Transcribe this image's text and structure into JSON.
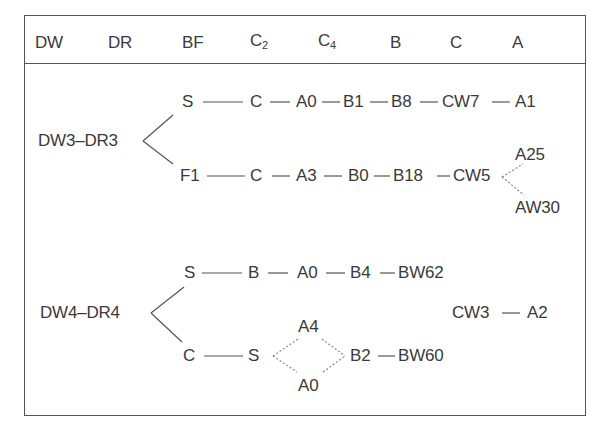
{
  "header": {
    "columns": [
      {
        "label": "DW"
      },
      {
        "label": "DR"
      },
      {
        "label": "BF"
      },
      {
        "label": "C",
        "sub": "2"
      },
      {
        "label": "C",
        "sub": "4"
      },
      {
        "label": "B"
      },
      {
        "label": "C"
      },
      {
        "label": "A"
      }
    ]
  },
  "group1": {
    "root": "DW3–DR3",
    "branch_upper": {
      "nodes": [
        "S",
        "C",
        "A0",
        "B1",
        "B8",
        "CW7",
        "A1"
      ]
    },
    "branch_lower": {
      "nodes": [
        "F1",
        "C",
        "A3",
        "B0",
        "B18",
        "CW5"
      ],
      "fork": [
        "A25",
        "AW30"
      ]
    }
  },
  "group2": {
    "root": "DW4–DR4",
    "branch_upper": {
      "nodes": [
        "S",
        "B",
        "A0",
        "B4",
        "BW62"
      ]
    },
    "branch_lower": {
      "nodes": [
        "C",
        "S"
      ],
      "fork": [
        "A4",
        "A0"
      ],
      "after_fork": [
        "B2",
        "BW60"
      ]
    },
    "detached": [
      "CW3",
      "A2"
    ]
  }
}
